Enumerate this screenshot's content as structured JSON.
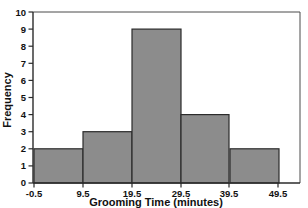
{
  "chart_data": {
    "type": "bar",
    "title": "",
    "subtitle": "",
    "xlabel": "Grooming Time (minutes)",
    "ylabel": "Frequency",
    "categories": [
      "-0.5 to 9.5",
      "9.5 to 19.5",
      "19.5 to 29.5",
      "29.5 to 39.5",
      "39.5 to 49.5"
    ],
    "bin_edges": [
      -0.5,
      9.5,
      19.5,
      29.5,
      39.5,
      49.5
    ],
    "values": [
      2,
      3,
      9,
      4,
      2
    ],
    "xtick_labels": [
      "-0.5",
      "9.5",
      "19.5",
      "29.5",
      "39.5",
      "49.5"
    ],
    "xtick_values": [
      -0.5,
      9.5,
      19.5,
      29.5,
      39.5,
      49.5
    ],
    "ytick_labels": [
      "0",
      "1",
      "2",
      "3",
      "4",
      "5",
      "6",
      "7",
      "8",
      "9",
      "10"
    ],
    "ytick_values": [
      0,
      1,
      2,
      3,
      4,
      5,
      6,
      7,
      8,
      9,
      10
    ],
    "xlim": [
      -0.5,
      60.0
    ],
    "ylim": [
      0,
      10
    ],
    "grid": false,
    "legend": false,
    "legend_position": "none",
    "bar_fill_color": "#8c8c8c",
    "bar_edge_color": "#2b2b2b",
    "axis_color": "#2b2b2b",
    "frame_color": "#4a4a4a",
    "background_color": "#ffffff"
  },
  "layout": {
    "plot_left": 33,
    "plot_right": 300,
    "plot_top": 12,
    "plot_bottom": 183,
    "bar_pixel_width": 49
  }
}
